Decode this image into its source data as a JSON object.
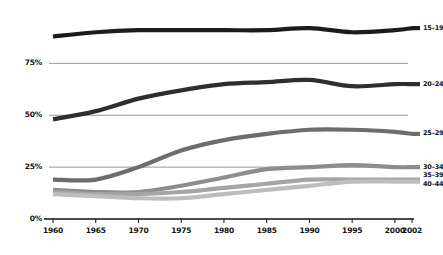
{
  "chart_data": {
    "type": "line",
    "title": "",
    "subtitle": "",
    "xlabel": "",
    "ylabel": "",
    "x": [
      1960,
      1965,
      1970,
      1975,
      1980,
      1985,
      1990,
      1995,
      2000,
      2002
    ],
    "xtick_labels": [
      "1960",
      "1965",
      "1970",
      "1975",
      "1980",
      "1985",
      "1990",
      "1995",
      "2000",
      "2002"
    ],
    "ytick_labels": [
      "0%",
      "25%",
      "50%",
      "75%"
    ],
    "ytick_values": [
      0,
      25,
      50,
      75
    ],
    "ylim": [
      0,
      100
    ],
    "xlim": [
      1960,
      2002
    ],
    "grid": "horizontal",
    "legend_position": "right-of-lines",
    "series": [
      {
        "name": "15–19",
        "label": "15–19",
        "color": "#1c1c1c",
        "values": [
          88,
          90,
          91,
          91,
          91,
          91,
          92,
          90,
          91,
          92
        ]
      },
      {
        "name": "20–24",
        "label": "20–24",
        "color": "#2e2e2e",
        "values": [
          48,
          52,
          58,
          62,
          65,
          66,
          67,
          64,
          65,
          65
        ]
      },
      {
        "name": "25–29",
        "label": "25–29",
        "color": "#6d6d6d",
        "values": [
          19,
          19,
          25,
          33,
          38,
          41,
          43,
          43,
          42,
          41
        ]
      },
      {
        "name": "30–34",
        "label": "30–34",
        "color": "#8d8d8d",
        "values": [
          14,
          13,
          13,
          16,
          20,
          24,
          25,
          26,
          25,
          25
        ]
      },
      {
        "name": "35–39",
        "label": "35–39",
        "color": "#a5a5a5",
        "values": [
          13,
          12,
          12,
          13,
          15,
          17,
          19,
          19,
          19,
          19
        ]
      },
      {
        "name": "40–44",
        "label": "40–44",
        "color": "#bdbdbd",
        "values": [
          12,
          11,
          10,
          10,
          12,
          14,
          16,
          18,
          18,
          18
        ]
      }
    ],
    "annotations": []
  },
  "axis": {
    "baseline_label": "0%",
    "gridline_labels": [
      "25%",
      "50%",
      "75%"
    ]
  },
  "colors": {
    "background": "#ffffff",
    "axis": "#111111",
    "gridline": "#6f6f6f",
    "text": "#111111"
  }
}
